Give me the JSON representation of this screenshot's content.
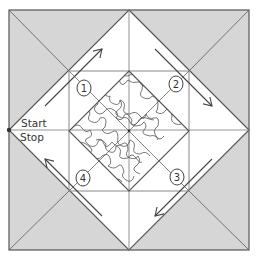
{
  "diagram": {
    "type": "quilt-block-stitching-path",
    "labels": {
      "start": "Start",
      "stop": "Stop"
    },
    "steps": [
      {
        "number": "1",
        "direction": "up-right"
      },
      {
        "number": "2",
        "direction": "down-right"
      },
      {
        "number": "3",
        "direction": "down-left"
      },
      {
        "number": "4",
        "direction": "up-left"
      }
    ],
    "colors": {
      "background": "#ffffff",
      "shaded_triangles": "#d6d6d6",
      "lines": "#555555",
      "light_lines": "#8a8a8a",
      "meander": "#555555"
    }
  }
}
